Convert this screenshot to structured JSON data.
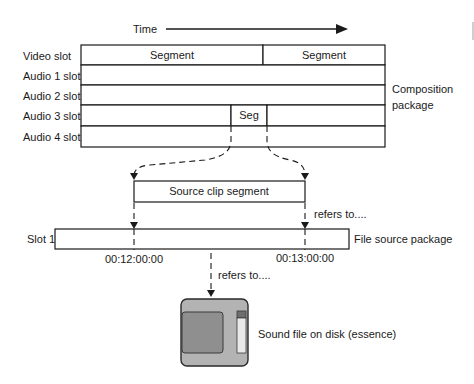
{
  "time_axis": {
    "label": "Time"
  },
  "composition": {
    "label_line1": "Composition",
    "label_line2": "package",
    "slots": [
      {
        "label": "Video slot",
        "segments": [
          "Segment",
          "Segment"
        ]
      },
      {
        "label": "Audio 1 slot",
        "segments": []
      },
      {
        "label": "Audio 2 slot",
        "segments": []
      },
      {
        "label": "Audio 3 slot",
        "segments": [
          "Seg"
        ]
      },
      {
        "label": "Audio 4 slot",
        "segments": []
      }
    ]
  },
  "source_clip": {
    "label": "Source clip segment"
  },
  "refers_to_1": "refers to....",
  "file_source": {
    "slot_label": "Slot 1",
    "label": "File source package",
    "start_timecode": "00:12:00:00",
    "end_timecode": "00:13:00:00"
  },
  "refers_to_2": "refers to....",
  "essence": {
    "icon": "disk-icon",
    "label": "Sound file on disk (essence)",
    "colors": {
      "body": "#b3b3b3",
      "label_panel": "#8f8f8f",
      "shutter": "#e9e9e9",
      "shutter_top": "#6e6e6e"
    }
  }
}
